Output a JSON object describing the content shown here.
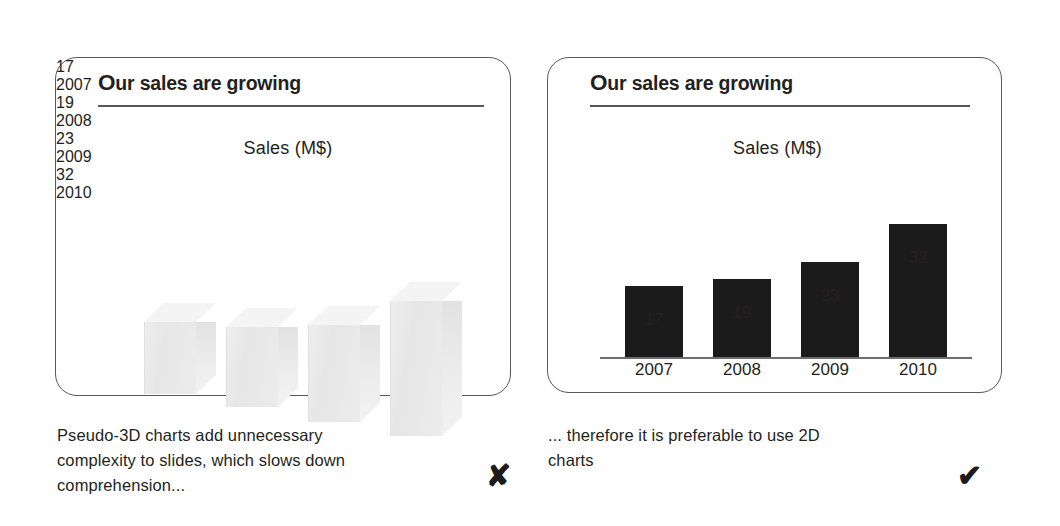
{
  "slide": {
    "left_panel": {
      "title_initial": "O",
      "title_rest": "ur sales are growing",
      "axis_title": "Sales (M$)",
      "caption": "Pseudo-3D charts add unnecessary\ncomplexity to slides, which slows down\ncomprehension...",
      "verdict_icon": "✘",
      "verdict_name": "cross-mark-icon"
    },
    "right_panel": {
      "title_initial": "O",
      "title_rest": "ur sales are growing",
      "axis_title": "Sales (M$)",
      "caption": "... therefore it is preferable to use 2D\ncharts",
      "verdict_icon": "✔",
      "verdict_name": "check-mark-icon"
    }
  },
  "chart_data": [
    {
      "type": "bar",
      "render": "pseudo-3d",
      "title": "Our sales are growing",
      "ylabel": "Sales (M$)",
      "xlabel": "",
      "categories": [
        "2007",
        "2008",
        "2009",
        "2010"
      ],
      "values": [
        17,
        19,
        23,
        32
      ],
      "value_labels": [
        "17",
        "19",
        "23",
        "32"
      ],
      "ylim": [
        0,
        32
      ],
      "grid": false,
      "axis_visible": false,
      "legend": "none",
      "bar_color": "#e9e9e9"
    },
    {
      "type": "bar",
      "render": "2d",
      "title": "Our sales are growing",
      "ylabel": "Sales (M$)",
      "xlabel": "",
      "categories": [
        "2007",
        "2008",
        "2009",
        "2010"
      ],
      "values": [
        17,
        19,
        23,
        32
      ],
      "value_labels": [
        "17",
        "19",
        "23",
        "32"
      ],
      "ylim": [
        0,
        32
      ],
      "grid": false,
      "axis_visible": true,
      "legend": "none",
      "bar_color": "#1b1b1b"
    }
  ],
  "geometry": {
    "bars3d": [
      {
        "left": 88,
        "bottom": 336,
        "w": 52,
        "h": 72,
        "dx": 20,
        "dy": 19,
        "val_x": 80,
        "val_y": 225,
        "cat_x": 78,
        "cat_y": 316
      },
      {
        "left": 170,
        "bottom": 349,
        "w": 52,
        "h": 80,
        "dx": 20,
        "dy": 19,
        "val_x": 162,
        "val_y": 235,
        "cat_x": 160,
        "cat_y": 329
      },
      {
        "left": 252,
        "bottom": 364,
        "w": 52,
        "h": 97,
        "dx": 20,
        "dy": 19,
        "val_x": 244,
        "val_y": 226,
        "cat_x": 242,
        "cat_y": 344
      },
      {
        "left": 334,
        "bottom": 378,
        "w": 52,
        "h": 135,
        "dx": 20,
        "dy": 19,
        "val_x": 326,
        "val_y": 203,
        "cat_x": 324,
        "cat_y": 358
      }
    ],
    "bars2d": [
      {
        "left": 77,
        "w": 58,
        "h": 71,
        "val_y": 252,
        "cat_y": 302
      },
      {
        "left": 165,
        "w": 58,
        "h": 78,
        "val_y": 245,
        "cat_y": 302
      },
      {
        "left": 253,
        "w": 58,
        "h": 95,
        "val_y": 228,
        "cat_y": 302
      },
      {
        "left": 341,
        "w": 58,
        "h": 133,
        "val_y": 190,
        "cat_y": 302
      }
    ],
    "baseline": {
      "left": 52,
      "top": 299,
      "width": 372
    }
  }
}
